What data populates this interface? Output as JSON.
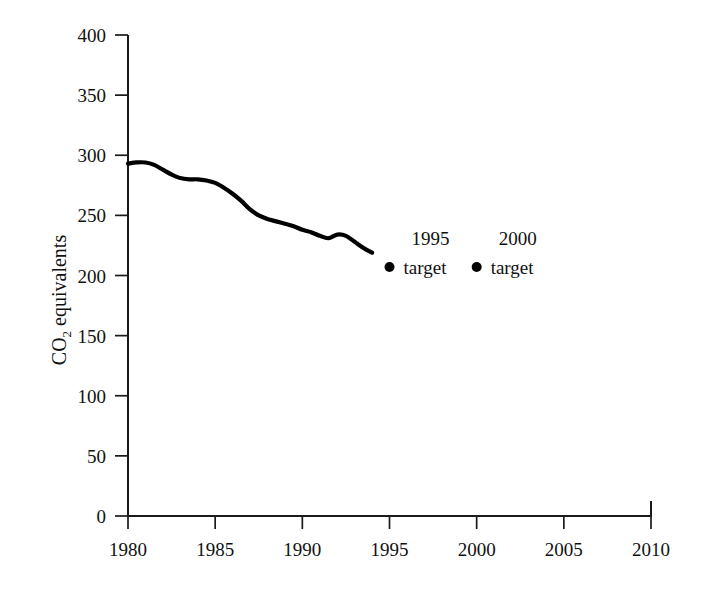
{
  "chart_data": {
    "type": "line",
    "title": "",
    "xlabel": "",
    "ylabel": "CO2 equivalents",
    "ylabel_main": "CO",
    "ylabel_sub": "2",
    "ylabel_tail": " equivalents",
    "xlim": [
      1980,
      2010
    ],
    "ylim": [
      0,
      400
    ],
    "grid": false,
    "legend": "none",
    "x_ticks": [
      1980,
      1985,
      1990,
      1995,
      2000,
      2005,
      2010
    ],
    "x_tick_labels": [
      "1980",
      "1985",
      "1990",
      "1995",
      "2000",
      "2005",
      "2010"
    ],
    "y_ticks": [
      0,
      50,
      100,
      150,
      200,
      250,
      300,
      350,
      400
    ],
    "y_tick_labels": [
      "0",
      "50",
      "100",
      "150",
      "200",
      "250",
      "300",
      "350",
      "400"
    ],
    "series": [
      {
        "name": "emissions",
        "type": "line",
        "color": "#000000",
        "x": [
          1980,
          1980.5,
          1981,
          1981.5,
          1982,
          1982.5,
          1983,
          1983.5,
          1984,
          1984.5,
          1985,
          1985.5,
          1986,
          1986.5,
          1987,
          1987.5,
          1988,
          1988.5,
          1989,
          1989.5,
          1990,
          1990.5,
          1991,
          1991.5,
          1992,
          1992.5,
          1993,
          1993.5,
          1994
        ],
        "values": [
          293,
          294,
          294,
          292,
          288,
          284,
          281,
          280,
          280,
          279,
          277,
          273,
          268,
          262,
          255,
          250,
          247,
          245,
          243,
          241,
          238,
          236,
          233,
          231,
          234,
          233,
          228,
          223,
          219
        ]
      }
    ],
    "points": [
      {
        "name": "1995-target",
        "label_line1": "1995",
        "label_line2": "target",
        "x": 1995,
        "y": 207,
        "marker": "circle",
        "color": "#000000"
      },
      {
        "name": "2000-target",
        "label_line1": "2000",
        "label_line2": "target",
        "x": 2000,
        "y": 207,
        "marker": "circle",
        "color": "#000000"
      }
    ],
    "colors": {
      "axis": "#1a1a1a",
      "line": "#000000",
      "marker": "#000000",
      "background": "#ffffff"
    }
  }
}
